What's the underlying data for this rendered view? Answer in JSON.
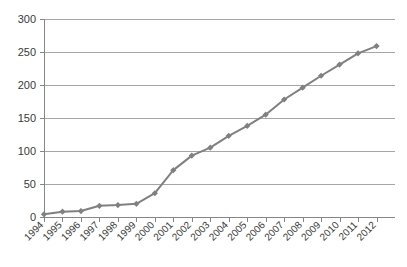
{
  "chart_data": {
    "type": "line",
    "title": "",
    "subtitle": "",
    "xlabel": "",
    "ylabel": "",
    "categories": [
      "1994",
      "1995",
      "1996",
      "1997",
      "1998",
      "1999",
      "2000",
      "2001",
      "2002",
      "2003",
      "2004",
      "2005",
      "2006",
      "2007",
      "2008",
      "2009",
      "2010",
      "2011",
      "2012"
    ],
    "values": [
      4,
      8,
      9,
      17,
      18,
      20,
      36,
      71,
      93,
      105,
      123,
      138,
      155,
      178,
      196,
      214,
      231,
      248,
      259
    ],
    "series": [
      {
        "name": "Series 1",
        "values": [
          4,
          8,
          9,
          17,
          18,
          20,
          36,
          71,
          93,
          105,
          123,
          138,
          155,
          178,
          196,
          214,
          231,
          248,
          259
        ]
      }
    ],
    "ylim": [
      0,
      300
    ],
    "y_ticks": [
      0,
      50,
      100,
      150,
      200,
      250,
      300
    ],
    "y_tick_labels": [
      "0",
      "50",
      "100",
      "150",
      "200",
      "250",
      "300"
    ],
    "x_tick_labels": [
      "1994",
      "1995",
      "1996",
      "1997",
      "1998",
      "1999",
      "2000",
      "2001",
      "2002",
      "2003",
      "2004",
      "2005",
      "2006",
      "2007",
      "2008",
      "2009",
      "2010",
      "2011",
      "2012"
    ],
    "grid": true,
    "grid_axis": "y",
    "legend": false,
    "legend_position": "none",
    "marker": "diamond",
    "annotations": []
  },
  "style": {
    "series_color": "#808080",
    "grid_color": "#a6a6a6",
    "axis_color": "#868686",
    "text_color": "#3a3a3a",
    "background": "#ffffff"
  }
}
